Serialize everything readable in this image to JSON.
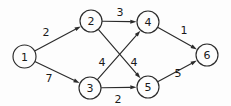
{
  "figure": {
    "kind": "directed-weighted-graph",
    "background_color": "#fdfdfd",
    "stroke_color": "#2b2b2b",
    "text_color": "#1a1a1a",
    "width": 231,
    "height": 106
  },
  "chart_data": {
    "type": "diagram",
    "title": "",
    "xlabel": "",
    "ylabel": "",
    "directed": true,
    "weighted": true,
    "nodes": [
      {
        "id": "1",
        "label": "1",
        "cx": 24.5,
        "cy": 56.5,
        "r": 11.5
      },
      {
        "id": "2",
        "label": "2",
        "cx": 91.0,
        "cy": 21.0,
        "r": 11.0
      },
      {
        "id": "3",
        "label": "3",
        "cx": 90.0,
        "cy": 88.0,
        "r": 11.0
      },
      {
        "id": "4",
        "label": "4",
        "cx": 148.0,
        "cy": 22.0,
        "r": 11.0
      },
      {
        "id": "5",
        "label": "5",
        "cx": 148.0,
        "cy": 87.0,
        "r": 11.0
      },
      {
        "id": "6",
        "label": "6",
        "cx": 207.0,
        "cy": 55.0,
        "r": 11.0
      }
    ],
    "edges": [
      {
        "from": "1",
        "to": "2",
        "weight": "2",
        "lx": 46,
        "ly": 32
      },
      {
        "from": "1",
        "to": "3",
        "weight": "7",
        "lx": 49,
        "ly": 78
      },
      {
        "from": "2",
        "to": "4",
        "weight": "3",
        "lx": 120,
        "ly": 12
      },
      {
        "from": "2",
        "to": "5",
        "weight": "4",
        "lx": 134,
        "ly": 62
      },
      {
        "from": "3",
        "to": "4",
        "weight": "4",
        "lx": 102,
        "ly": 62
      },
      {
        "from": "3",
        "to": "5",
        "weight": "2",
        "lx": 118,
        "ly": 99
      },
      {
        "from": "4",
        "to": "6",
        "weight": "1",
        "lx": 184,
        "ly": 30
      },
      {
        "from": "5",
        "to": "6",
        "weight": "5",
        "lx": 178,
        "ly": 73
      }
    ]
  }
}
